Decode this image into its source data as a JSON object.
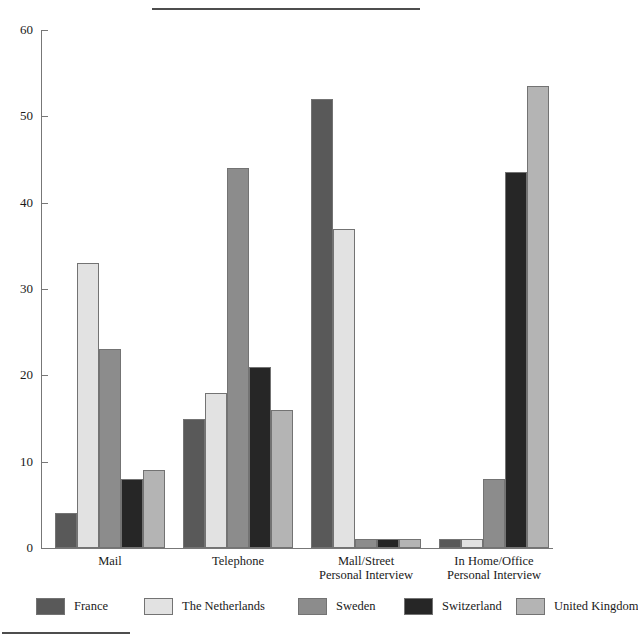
{
  "chart_data": {
    "type": "bar",
    "title": "",
    "subtitle": "",
    "xlabel": "",
    "ylabel": "",
    "ylim": [
      0,
      60
    ],
    "yticks": [
      0,
      10,
      20,
      30,
      40,
      50,
      60
    ],
    "grid": false,
    "legend_position": "bottom",
    "categories": [
      "Mail",
      "Telephone",
      "Mall/Street\nPersonal Interview",
      "In Home/Office\nPersonal Interview"
    ],
    "series": [
      {
        "name": "France",
        "color": "#595959",
        "values": [
          4,
          15,
          52,
          1
        ]
      },
      {
        "name": "The Netherlands",
        "color": "#e2e2e2",
        "values": [
          33,
          18,
          37,
          1
        ]
      },
      {
        "name": "Sweden",
        "color": "#8c8c8c",
        "values": [
          23,
          44,
          1,
          8
        ]
      },
      {
        "name": "Switzerland",
        "color": "#262626",
        "values": [
          8,
          21,
          1,
          43.5
        ]
      },
      {
        "name": "United Kingdom",
        "color": "#b4b4b4",
        "values": [
          9,
          16,
          1,
          53.5
        ]
      }
    ]
  }
}
